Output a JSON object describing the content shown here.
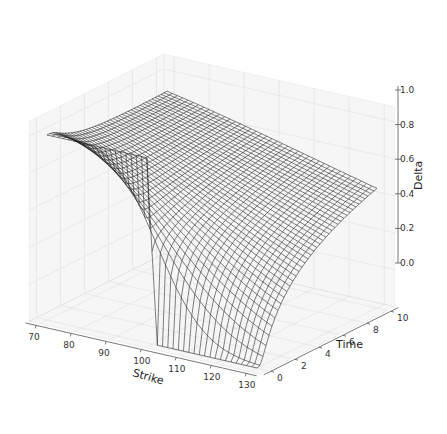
{
  "chart_data": {
    "type": "surface-wireframe-3d",
    "title": "",
    "xlabel": "Strike",
    "ylabel": "Time",
    "zlabel": "Delta",
    "x_ticks": [
      70,
      80,
      90,
      100,
      110,
      120,
      130
    ],
    "y_ticks": [
      0,
      2,
      4,
      6,
      8,
      10
    ],
    "z_ticks": [
      "0.0",
      "0.2",
      "0.4",
      "0.6",
      "0.8",
      "1.0"
    ],
    "xlim": [
      70,
      130
    ],
    "ylim": [
      0,
      10
    ],
    "zlim": [
      0,
      1
    ],
    "grid": true,
    "legend": null,
    "surface": {
      "description": "Black-Scholes call delta vs strike and time to maturity",
      "spot": 100,
      "rate": 0.03,
      "volatility": 0.2,
      "strike_range": [
        70,
        130
      ],
      "time_range": [
        0,
        10
      ],
      "grid_lines": 40,
      "wire_color": "#1a1a1a"
    },
    "sample_values": [
      {
        "strike": 70,
        "time": 0,
        "delta": 1.0
      },
      {
        "strike": 70,
        "time": 10,
        "delta": 0.91
      },
      {
        "strike": 100,
        "time": 0,
        "delta": 0.5
      },
      {
        "strike": 130,
        "time": 0,
        "delta": 0.0
      },
      {
        "strike": 130,
        "time": 10,
        "delta": 0.65
      }
    ]
  }
}
